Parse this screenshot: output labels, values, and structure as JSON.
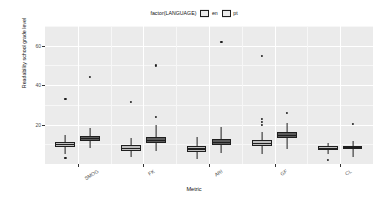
{
  "chart_data": {
    "type": "boxplot",
    "title": "",
    "xlabel": "Metric",
    "ylabel": "Readability school grade level",
    "ylim": [
      0,
      70
    ],
    "yticks": [
      20,
      40,
      60
    ],
    "ytick_labels": [
      "20",
      "40",
      "60"
    ],
    "grid": true,
    "legend": {
      "title": "factor(LANGUAGE)",
      "position": "top",
      "orientation": "horizontal",
      "entries": [
        {
          "label": "en",
          "color": "#BFBFBF"
        },
        {
          "label": "pt",
          "color": "#5A5A5A"
        }
      ]
    },
    "categories": [
      "SMOG",
      "FK",
      "ARI",
      "GF",
      "CL"
    ],
    "series": [
      {
        "name": "en",
        "boxes": [
          {
            "category": "SMOG",
            "min": 5.0,
            "q1": 8.5,
            "median": 9.8,
            "q3": 11.0,
            "max": 14.5,
            "outliers": [
              3.0,
              33.0
            ]
          },
          {
            "category": "FK",
            "min": 3.5,
            "q1": 6.8,
            "median": 8.0,
            "q3": 9.4,
            "max": 13.0,
            "outliers": [
              31.5
            ]
          },
          {
            "category": "ARI",
            "min": 2.5,
            "q1": 6.0,
            "median": 7.6,
            "q3": 9.2,
            "max": 13.5,
            "outliers": []
          },
          {
            "category": "GF",
            "min": 5.0,
            "q1": 9.0,
            "median": 10.5,
            "q3": 12.0,
            "max": 16.0,
            "outliers": [
              20.0,
              21.5,
              23.0,
              55.0
            ]
          },
          {
            "category": "CL",
            "min": 5.0,
            "q1": 7.2,
            "median": 8.0,
            "q3": 9.0,
            "max": 10.5,
            "outliers": [
              2.0
            ]
          }
        ]
      },
      {
        "name": "pt",
        "boxes": [
          {
            "category": "SMOG",
            "min": 8.0,
            "q1": 11.5,
            "median": 12.8,
            "q3": 14.2,
            "max": 18.5,
            "outliers": [
              44.0
            ]
          },
          {
            "category": "FK",
            "min": 6.5,
            "q1": 10.5,
            "median": 12.0,
            "q3": 13.6,
            "max": 20.0,
            "outliers": [
              24.0,
              50.0
            ]
          },
          {
            "category": "ARI",
            "min": 5.5,
            "q1": 9.5,
            "median": 11.0,
            "q3": 12.8,
            "max": 19.0,
            "outliers": [
              62.0
            ]
          },
          {
            "category": "GF",
            "min": 7.5,
            "q1": 13.0,
            "median": 14.5,
            "q3": 16.2,
            "max": 21.0,
            "outliers": [
              26.0
            ]
          },
          {
            "category": "CL",
            "min": 3.5,
            "q1": 7.5,
            "median": 8.4,
            "q3": 9.3,
            "max": 11.5,
            "outliers": [
              20.5
            ]
          }
        ]
      }
    ]
  }
}
